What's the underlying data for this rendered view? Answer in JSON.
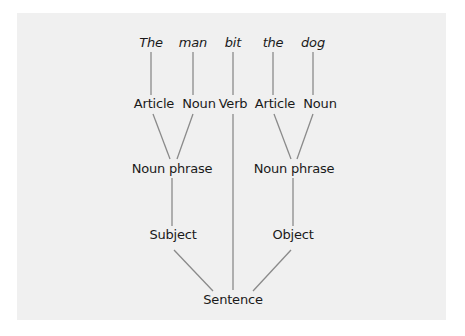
{
  "diagram": {
    "type": "parse-tree",
    "words": [
      "The",
      "man",
      "bit",
      "the",
      "dog"
    ],
    "level1": [
      "Article",
      "Noun",
      "Verb",
      "Article",
      "Noun"
    ],
    "level2": [
      "Noun phrase",
      "Noun phrase"
    ],
    "level3": [
      "Subject",
      "Object"
    ],
    "root": "Sentence",
    "colors": {
      "panel": "#f0f0f0",
      "line": "#8a8a8a",
      "text": "#1a1a1a"
    }
  }
}
